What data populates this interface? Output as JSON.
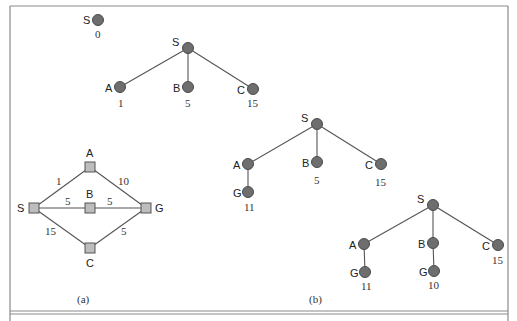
{
  "figure": {
    "caption_a": "(a)",
    "caption_b": "(b)"
  },
  "graph_a": {
    "nodes": [
      {
        "id": "S",
        "label": "S",
        "x": 34,
        "y": 208
      },
      {
        "id": "A",
        "label": "A",
        "x": 90,
        "y": 167
      },
      {
        "id": "B",
        "label": "B",
        "x": 90,
        "y": 208
      },
      {
        "id": "C",
        "label": "C",
        "x": 90,
        "y": 248
      },
      {
        "id": "G",
        "label": "G",
        "x": 146,
        "y": 208
      }
    ],
    "edges": [
      {
        "from": "S",
        "to": "A",
        "weight": "1"
      },
      {
        "from": "A",
        "to": "G",
        "weight": "10"
      },
      {
        "from": "S",
        "to": "B",
        "weight": "5"
      },
      {
        "from": "B",
        "to": "G",
        "weight": "5"
      },
      {
        "from": "S",
        "to": "C",
        "weight": "15"
      },
      {
        "from": "C",
        "to": "G",
        "weight": "5"
      }
    ]
  },
  "trees_b": [
    {
      "step": 0,
      "nodes": [
        {
          "label": "S",
          "cost": "0",
          "x": 98,
          "y": 20
        }
      ]
    },
    {
      "step": 1,
      "nodes": [
        {
          "label": "S",
          "cost": "",
          "x": 188,
          "y": 48
        },
        {
          "label": "A",
          "cost": "1",
          "x": 120,
          "y": 87
        },
        {
          "label": "B",
          "cost": "5",
          "x": 188,
          "y": 87
        },
        {
          "label": "C",
          "cost": "15",
          "x": 253,
          "y": 89
        }
      ]
    },
    {
      "step": 2,
      "nodes": [
        {
          "label": "S",
          "cost": "",
          "x": 317,
          "y": 124
        },
        {
          "label": "A",
          "cost": "",
          "x": 248,
          "y": 164
        },
        {
          "label": "B",
          "cost": "5",
          "x": 317,
          "y": 162
        },
        {
          "label": "C",
          "cost": "15",
          "x": 381,
          "y": 164
        },
        {
          "label": "G",
          "cost": "11",
          "x": 248,
          "y": 192
        }
      ]
    },
    {
      "step": 3,
      "nodes": [
        {
          "label": "S",
          "cost": "",
          "x": 433,
          "y": 205
        },
        {
          "label": "A",
          "cost": "",
          "x": 364,
          "y": 244
        },
        {
          "label": "B",
          "cost": "",
          "x": 433,
          "y": 243
        },
        {
          "label": "C",
          "cost": "15",
          "x": 498,
          "y": 245
        },
        {
          "label": "G",
          "cost": "11",
          "x": 365,
          "y": 272
        },
        {
          "label": "G",
          "cost": "10",
          "x": 434,
          "y": 271
        }
      ]
    }
  ],
  "colors": {
    "node_fill": "#6e6e6e",
    "square_fill": "#bdbdbd",
    "edge": "#555555",
    "frame": "#8a8a8a"
  }
}
